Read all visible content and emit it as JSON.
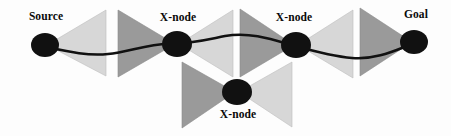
{
  "diagram": {
    "canvas": {
      "width": 451,
      "height": 136,
      "background": "#fdfdfd"
    },
    "colors": {
      "triangle_light": "#d7d7d7",
      "triangle_dark": "#9a9a9a",
      "node": "#111111",
      "path": "#111111",
      "label": "#0a0a0a"
    },
    "nodes": [
      {
        "id": "source",
        "label": "Source",
        "cx": 45,
        "cy": 45,
        "rx": 14,
        "ry": 12,
        "label_x": 46,
        "label_y": 20,
        "label_anchor": "middle"
      },
      {
        "id": "xnode-1",
        "label": "X-node",
        "cx": 177,
        "cy": 44,
        "rx": 15,
        "ry": 13,
        "label_x": 178,
        "label_y": 21,
        "label_anchor": "middle"
      },
      {
        "id": "xnode-2",
        "label": "X-node",
        "cx": 296,
        "cy": 45,
        "rx": 15,
        "ry": 13,
        "label_x": 294,
        "label_y": 21,
        "label_anchor": "middle"
      },
      {
        "id": "goal",
        "label": "Goal",
        "cx": 414,
        "cy": 42,
        "rx": 14,
        "ry": 12,
        "label_x": 416,
        "label_y": 18,
        "label_anchor": "middle"
      },
      {
        "id": "xnode-3",
        "label": "X-node",
        "cx": 237,
        "cy": 92,
        "rx": 15,
        "ry": 13,
        "label_x": 238,
        "label_y": 118,
        "label_anchor": "middle"
      }
    ],
    "triangles": [
      {
        "id": "tri-source-out",
        "shade": "light",
        "points": "47,45 106,10 106,76"
      },
      {
        "id": "tri-x1-in",
        "shade": "dark",
        "points": "175,44 118,10 118,77"
      },
      {
        "id": "tri-x1-out",
        "shade": "light",
        "points": "179,44 233,10 233,77"
      },
      {
        "id": "tri-x2-in",
        "shade": "dark",
        "points": "294,45 240,9 240,77"
      },
      {
        "id": "tri-x2-out",
        "shade": "light",
        "points": "298,45 353,10 353,78"
      },
      {
        "id": "tri-goal-in",
        "shade": "dark",
        "points": "412,42 360,8 360,76"
      },
      {
        "id": "tri-x3-in",
        "shade": "dark",
        "points": "235,92 182,62 182,128"
      },
      {
        "id": "tri-x3-out",
        "shade": "light",
        "points": "239,92 292,62 292,127"
      }
    ],
    "path": {
      "id": "source-to-goal-path",
      "d": "M 47,47 C 70,52 88,56 108,54 C 128,52 148,44 168,44 C 190,44 205,40 225,36 C 248,32 268,38 288,44 C 310,50 330,56 352,58 C 376,60 396,50 412,44"
    }
  }
}
